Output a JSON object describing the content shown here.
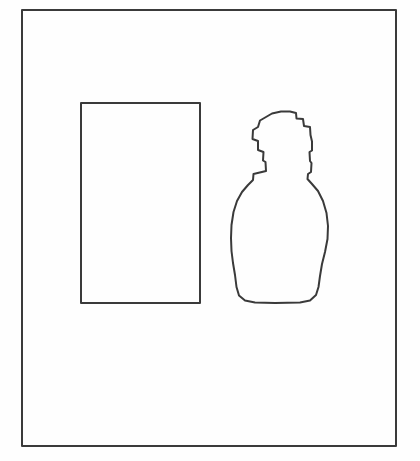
{
  "figure": {
    "title": "Line drawing: rectangle and vase silhouette in a frame",
    "background_color": "#fefefe",
    "canvas": {
      "width": 420,
      "height": 461
    },
    "stroke_color": "#3a3a3a",
    "fill_color": "#ffffff"
  },
  "chart_data": {
    "type": "diagram",
    "xlabel": "",
    "ylabel": "",
    "grid": false,
    "legend": null,
    "xlim": [
      0,
      420
    ],
    "ylim": [
      0,
      461
    ],
    "shapes": [
      {
        "name": "outer-frame",
        "kind": "rectangle",
        "x": 22,
        "y": 10,
        "width": 374,
        "height": 436,
        "stroke": "#3a3a3a",
        "stroke_width": 2,
        "fill": "#ffffff"
      },
      {
        "name": "inner-rectangle",
        "kind": "rectangle",
        "x": 81,
        "y": 103,
        "width": 119,
        "height": 200,
        "stroke": "#3a3a3a",
        "stroke_width": 2,
        "fill": "#ffffff"
      },
      {
        "name": "vase-silhouette",
        "kind": "path",
        "bbox": {
          "x": 231,
          "y": 111,
          "width": 97,
          "height": 192
        },
        "stroke": "#3a3a3a",
        "stroke_width": 2,
        "fill": "#ffffff",
        "path": "M 266 171 L 265.5 162 L 263 160.5 L 263.5 152 L 258 150 L 258 141 L 252.5 139 L 253 130 L 258 127 L 260 120.5 L 266 117 L 272 113.5 L 281 111.5 L 290 111.5 L 296 113 L 296.5 118.5 L 303 119 L 304 126 L 310 127 L 310.5 135 L 312 141.5 L 312 150.5 L 309.5 152 L 310 161 L 311.5 163 L 311 172 L 308 174 L 307.5 179 L 312 184 L 318 191 L 323 201 L 326.5 213 L 328 226 L 327.5 239 L 325 252 L 322 264 L 320 276 L 318.5 287 L 316 295 L 310 300.5 L 300 302.5 L 275 303 L 255 302.5 L 245 300.5 L 239 295.5 L 236.5 287 L 235 275 L 233 263 L 231.5 251 L 231 238 L 231.5 225 L 233.5 212 L 237 201 L 242 192 L 248 185 L 253 180 L 253.5 174 Z"
      }
    ]
  }
}
